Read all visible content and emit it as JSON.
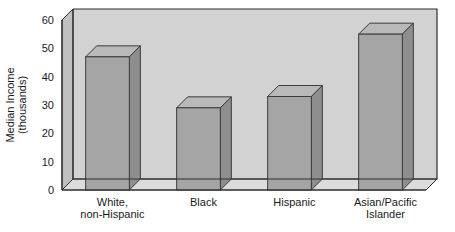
{
  "chart_data": {
    "type": "bar",
    "title": "",
    "xlabel": "",
    "ylabel": "Median Income (thousands)",
    "ylabel_line1": "Median Income",
    "ylabel_line2": "(thousands)",
    "categories": [
      "White, non-Hispanic",
      "Black",
      "Hispanic",
      "Asian/Pacific Islander"
    ],
    "category_lines": [
      [
        "White,",
        "non-Hispanic"
      ],
      [
        "Black",
        ""
      ],
      [
        "Hispanic",
        ""
      ],
      [
        "Asian/Pacific",
        "Islander"
      ]
    ],
    "values": [
      47,
      29,
      33,
      55
    ],
    "ylim": [
      0,
      60
    ],
    "yticks": [
      0,
      10,
      20,
      30,
      40,
      50,
      60
    ],
    "ytick_labels": [
      "0",
      "10",
      "20",
      "30",
      "40",
      "50",
      "60"
    ],
    "grid": true,
    "grid_color": "#ffffff",
    "legend": "none",
    "style": "3d-column",
    "colors": {
      "bar_front": "#a5a5a5",
      "bar_top": "#b9b9b9",
      "bar_side": "#8e8e8e",
      "bar_outline": "#3c3c3c",
      "plot_background": "#d2d2d2",
      "wall_side": "#c0c0c0",
      "floor": "#dcdcdc",
      "frame": "#2e2e2e",
      "page_background": "#ffffff",
      "text": "#1a1a1a"
    }
  }
}
